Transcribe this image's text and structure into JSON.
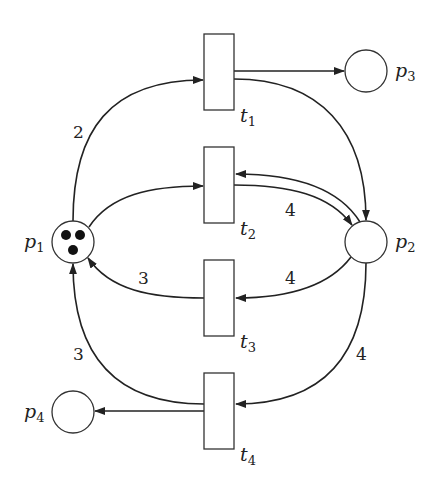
{
  "diagram": {
    "type": "petri-net",
    "places": [
      {
        "id": "p1",
        "label": "p",
        "sub": "1",
        "tokens": 3
      },
      {
        "id": "p2",
        "label": "p",
        "sub": "2",
        "tokens": 0
      },
      {
        "id": "p3",
        "label": "p",
        "sub": "3",
        "tokens": 0
      },
      {
        "id": "p4",
        "label": "p",
        "sub": "4",
        "tokens": 0
      }
    ],
    "transitions": [
      {
        "id": "t1",
        "label": "t",
        "sub": "1"
      },
      {
        "id": "t2",
        "label": "t",
        "sub": "2"
      },
      {
        "id": "t3",
        "label": "t",
        "sub": "3"
      },
      {
        "id": "t4",
        "label": "t",
        "sub": "4"
      }
    ],
    "arcs": [
      {
        "from": "p1",
        "to": "t1",
        "weight": "2"
      },
      {
        "from": "t1",
        "to": "p3",
        "weight": ""
      },
      {
        "from": "t1",
        "to": "p2",
        "weight": ""
      },
      {
        "from": "p1",
        "to": "t2",
        "weight": ""
      },
      {
        "from": "t2",
        "to": "p2",
        "weight": "4"
      },
      {
        "from": "p2",
        "to": "t2",
        "weight": ""
      },
      {
        "from": "p2",
        "to": "t3",
        "weight": "4"
      },
      {
        "from": "t3",
        "to": "p1",
        "weight": "3"
      },
      {
        "from": "p2",
        "to": "t4",
        "weight": "4"
      },
      {
        "from": "t4",
        "to": "p1",
        "weight": "3"
      },
      {
        "from": "t4",
        "to": "p4",
        "weight": ""
      }
    ],
    "weight_labels": {
      "p1_t1": "2",
      "t2_p2": "4",
      "p2_t3": "4",
      "t3_p1": "3",
      "t4_p1": "3",
      "p2_t4": "4"
    }
  }
}
